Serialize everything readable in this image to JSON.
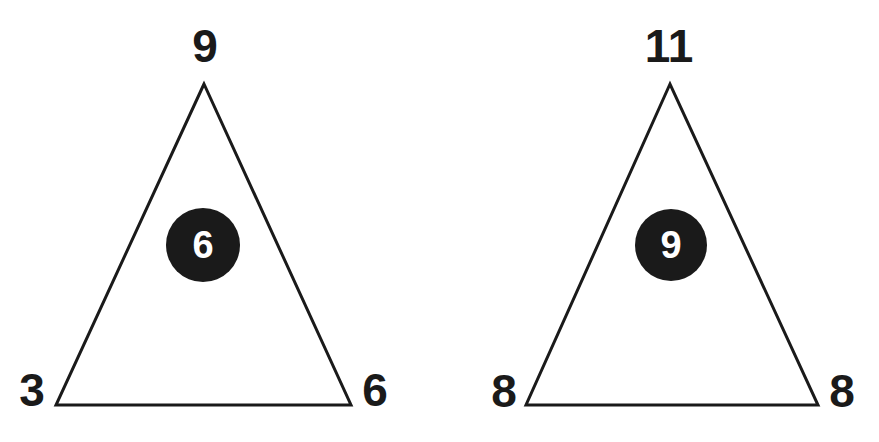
{
  "puzzle": {
    "type": "number-triangle",
    "colors": {
      "background": "#ffffff",
      "stroke": "#1a1a1a",
      "circle_fill": "#1a1a1a",
      "circle_text": "#ffffff"
    },
    "triangles": [
      {
        "top": "9",
        "bottom_left": "3",
        "bottom_right": "6",
        "center": "6"
      },
      {
        "top": "11",
        "bottom_left": "8",
        "bottom_right": "8",
        "center": "9"
      }
    ]
  }
}
